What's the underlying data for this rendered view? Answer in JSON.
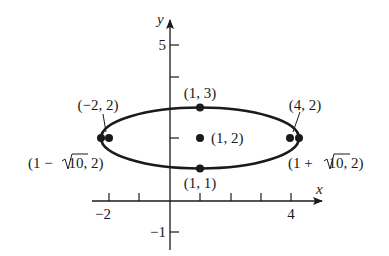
{
  "figure": {
    "type": "ellipse-graph",
    "equation_center": [
      1,
      2
    ],
    "semi_major": 3.1623,
    "semi_minor": 1,
    "axes": {
      "x_label": "x",
      "y_label": "y",
      "x_tick_labels": [
        {
          "value": -2,
          "text": "−2"
        },
        {
          "value": 4,
          "text": "4"
        }
      ],
      "y_tick_labels": [
        {
          "value": 5,
          "text": "5"
        },
        {
          "value": -1,
          "text": "−1"
        }
      ],
      "x_ticks": [
        -2,
        -1,
        1,
        2,
        3,
        4
      ],
      "y_ticks": [
        5,
        4,
        2,
        -1
      ]
    },
    "points": [
      {
        "name": "center",
        "coords": [
          1,
          2
        ],
        "label": "(1, 2)"
      },
      {
        "name": "top-vertex",
        "coords": [
          1,
          3
        ],
        "label": "(1, 3)"
      },
      {
        "name": "bottom-vertex",
        "coords": [
          1,
          1
        ],
        "label": "(1, 1)"
      },
      {
        "name": "left-focus",
        "coords": [
          -2,
          2
        ],
        "label": "(−2, 2)"
      },
      {
        "name": "right-focus",
        "coords": [
          4,
          2
        ],
        "label": "(4, 2)"
      },
      {
        "name": "left-vertex",
        "coords": [
          -2.1623,
          2
        ],
        "label_pre": "(1 − ",
        "label_rad": "10",
        "label_post": ", 2)"
      },
      {
        "name": "right-vertex",
        "coords": [
          4.1623,
          2
        ],
        "label_pre": "(1 + ",
        "label_rad": "10",
        "label_post": ", 2)"
      }
    ],
    "colors": {
      "ink": "#1a1a1a",
      "background": "#ffffff"
    }
  }
}
